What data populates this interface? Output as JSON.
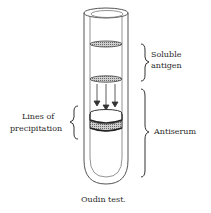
{
  "figure": {
    "caption": "Oudin test.",
    "labels": {
      "soluble_antigen": [
        "Soluble",
        "antigen"
      ],
      "lines_of_precipitation": [
        "Lines of",
        "precipitation"
      ],
      "antiserum": "Antiserum"
    },
    "components": {
      "tube": "test-tube",
      "antigen_layer_bands": 2,
      "diffusion_arrows": 3,
      "precipitation_bands": 2
    },
    "colors": {
      "line": "#3a3a3a",
      "band_fill": "#9a9a9a",
      "band_dark": "#555555"
    }
  }
}
